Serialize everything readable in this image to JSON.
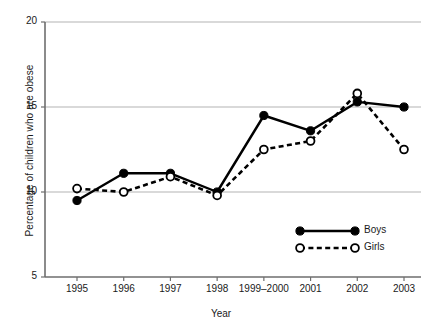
{
  "chart_data": {
    "type": "line",
    "title": "",
    "xlabel": "Year",
    "ylabel": "Percentage of children who are obese",
    "categories": [
      "1995",
      "1996",
      "1997",
      "1998",
      "1999–2000",
      "2001",
      "2002",
      "2003"
    ],
    "ylim": [
      5,
      20
    ],
    "yticks": [
      "5",
      "10",
      "15",
      "20"
    ],
    "ytick_values": [
      5,
      10,
      15,
      20
    ],
    "grid": "horizontal",
    "legend_position": "inside-bottom-right",
    "series": [
      {
        "name": "Boys",
        "marker": "filled-circle",
        "line_style": "solid",
        "color": "#000000",
        "values": [
          9.5,
          11.1,
          11.1,
          10.0,
          14.5,
          13.6,
          15.3,
          15.0
        ]
      },
      {
        "name": "Girls",
        "marker": "open-circle",
        "line_style": "dashed",
        "color": "#000000",
        "values": [
          10.2,
          10.0,
          10.9,
          9.8,
          12.5,
          13.0,
          15.8,
          12.5
        ]
      }
    ]
  },
  "axis": {
    "y_title": "Percentage of children who are obese",
    "x_title": "Year"
  },
  "legend": {
    "items": [
      {
        "label": "Boys"
      },
      {
        "label": "Girls"
      }
    ]
  },
  "colors": {
    "line": "#000000",
    "grid": "#b3b3b3",
    "axis": "#6e6e6e",
    "background": "#ffffff"
  }
}
